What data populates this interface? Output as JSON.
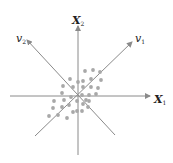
{
  "diagram": {
    "type": "pca-principal-axes",
    "colors": {
      "axis": "#8a8a8a",
      "dot": "#a8a8a8",
      "text": "#222222",
      "background": "#ffffff"
    },
    "labels": {
      "x1": {
        "main": "X",
        "sub": "1"
      },
      "x2": {
        "main": "X",
        "sub": "2"
      },
      "v1": {
        "main": "v",
        "sub": "1"
      },
      "v2": {
        "main": "v",
        "sub": "2"
      }
    },
    "axes": [
      {
        "name": "X1",
        "from": [
          10,
          96
        ],
        "to": [
          150,
          96
        ],
        "arrow": true
      },
      {
        "name": "X2",
        "from": [
          78,
          155
        ],
        "to": [
          78,
          26
        ],
        "arrow": true
      },
      {
        "name": "v1",
        "from": [
          35,
          136
        ],
        "to": [
          132,
          42
        ],
        "arrow": true
      },
      {
        "name": "v2",
        "from": [
          115,
          135
        ],
        "to": [
          27,
          40
        ],
        "arrow": true
      }
    ],
    "points": [
      [
        85,
        71
      ],
      [
        93,
        70
      ],
      [
        100,
        72
      ],
      [
        70,
        79
      ],
      [
        78,
        82
      ],
      [
        83,
        81
      ],
      [
        91,
        79
      ],
      [
        101,
        80
      ],
      [
        63,
        86
      ],
      [
        73,
        87
      ],
      [
        83,
        87
      ],
      [
        91,
        87
      ],
      [
        98,
        88
      ],
      [
        62,
        93
      ],
      [
        71,
        97
      ],
      [
        82,
        95
      ],
      [
        89,
        95
      ],
      [
        96,
        94
      ],
      [
        54,
        101
      ],
      [
        64,
        100
      ],
      [
        77,
        101
      ],
      [
        86,
        100
      ],
      [
        89,
        101
      ],
      [
        53,
        108
      ],
      [
        62,
        107
      ],
      [
        69,
        105
      ],
      [
        83,
        104
      ],
      [
        88,
        107
      ],
      [
        49,
        116
      ],
      [
        58,
        115
      ],
      [
        67,
        118
      ],
      [
        73,
        112
      ],
      [
        77,
        111
      ],
      [
        82,
        111
      ]
    ]
  }
}
